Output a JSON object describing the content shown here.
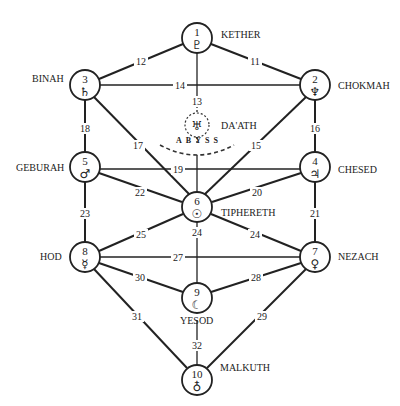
{
  "diagram": {
    "abyss_label": "ABYSS",
    "daath": {
      "name": "DA'ATH",
      "symbol": "♅",
      "icon": "uranus-icon"
    },
    "sephiroth": [
      {
        "number": "1",
        "name": "KETHER",
        "symbol": "♇",
        "icon": "pluto-icon"
      },
      {
        "number": "2",
        "name": "CHOKMAH",
        "symbol": "♆",
        "icon": "neptune-icon"
      },
      {
        "number": "3",
        "name": "BINAH",
        "symbol": "♄",
        "icon": "saturn-icon"
      },
      {
        "number": "4",
        "name": "CHESED",
        "symbol": "♃",
        "icon": "jupiter-icon"
      },
      {
        "number": "5",
        "name": "GEBURAH",
        "symbol": "♂",
        "icon": "mars-icon"
      },
      {
        "number": "6",
        "name": "TIPHERETH",
        "symbol": "☉",
        "icon": "sun-icon"
      },
      {
        "number": "7",
        "name": "NEZACH",
        "symbol": "♀",
        "icon": "venus-icon"
      },
      {
        "number": "8",
        "name": "HOD",
        "symbol": "☿",
        "icon": "mercury-icon"
      },
      {
        "number": "9",
        "name": "YESOD",
        "symbol": "☾",
        "icon": "moon-icon"
      },
      {
        "number": "10",
        "name": "MALKUTH",
        "symbol": "♁",
        "icon": "earth-icon"
      }
    ],
    "paths": [
      {
        "label": "11",
        "from": "1",
        "to": "2"
      },
      {
        "label": "12",
        "from": "1",
        "to": "3"
      },
      {
        "label": "13",
        "from": "1",
        "to": "6"
      },
      {
        "label": "14",
        "from": "2",
        "to": "3"
      },
      {
        "label": "15",
        "from": "2",
        "to": "6"
      },
      {
        "label": "16",
        "from": "2",
        "to": "4"
      },
      {
        "label": "17",
        "from": "3",
        "to": "6"
      },
      {
        "label": "18",
        "from": "3",
        "to": "5"
      },
      {
        "label": "19",
        "from": "4",
        "to": "5"
      },
      {
        "label": "20",
        "from": "4",
        "to": "6"
      },
      {
        "label": "21",
        "from": "4",
        "to": "7"
      },
      {
        "label": "22",
        "from": "5",
        "to": "6"
      },
      {
        "label": "23",
        "from": "5",
        "to": "8"
      },
      {
        "label": "24",
        "from": "6",
        "to": "7"
      },
      {
        "label": "25",
        "from": "6",
        "to": "9"
      },
      {
        "label": "26",
        "from": "6",
        "to": "8"
      },
      {
        "label": "27",
        "from": "7",
        "to": "8"
      },
      {
        "label": "28",
        "from": "7",
        "to": "9"
      },
      {
        "label": "29",
        "from": "7",
        "to": "10"
      },
      {
        "label": "30",
        "from": "8",
        "to": "9"
      },
      {
        "label": "31",
        "from": "8",
        "to": "10"
      },
      {
        "label": "32",
        "from": "9",
        "to": "10"
      }
    ]
  }
}
